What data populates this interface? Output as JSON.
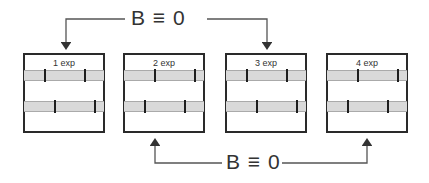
{
  "top_connector": {
    "label": "B ≡ 0",
    "from_box": 1,
    "to_box": 3,
    "arrow_direction": "down"
  },
  "bottom_connector": {
    "label": "B ≡ 0",
    "from_box": 2,
    "to_box": 4,
    "arrow_direction": "up"
  },
  "boxes": [
    {
      "label": "1 exp",
      "left": 23,
      "strip1_ticks": [
        20,
        80
      ],
      "strip2_ticks": [
        35,
        95
      ]
    },
    {
      "label": "2 exp",
      "left": 123,
      "strip1_ticks": [
        30,
        90
      ],
      "strip2_ticks": [
        20,
        80
      ]
    },
    {
      "label": "3 exp",
      "left": 225,
      "strip1_ticks": [
        20,
        80
      ],
      "strip2_ticks": [
        35,
        95
      ]
    },
    {
      "label": "4 exp",
      "left": 326,
      "strip1_ticks": [
        30,
        90
      ],
      "strip2_ticks": [
        20,
        80
      ]
    }
  ],
  "colors": {
    "line": "#555555",
    "border": "#2a2a2a",
    "strip": "#d9d9d9",
    "tick": "#1e1e1e"
  }
}
